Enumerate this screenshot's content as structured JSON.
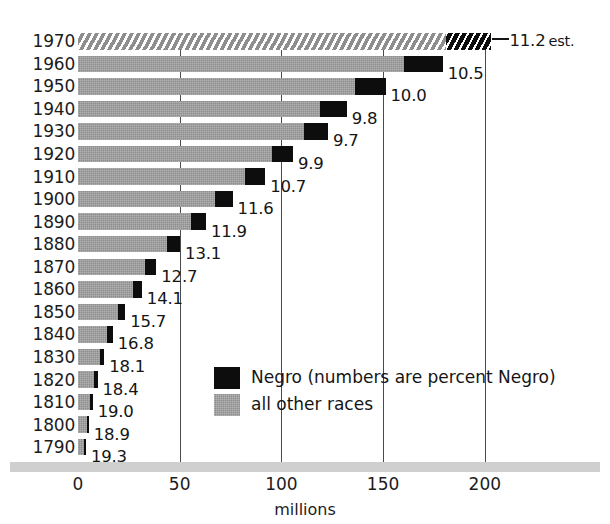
{
  "chart_data": {
    "type": "bar",
    "title": "",
    "subtitle": "",
    "xlabel": "millions",
    "ylabel": "",
    "xlim": [
      0,
      215
    ],
    "ylim": [],
    "grid": "vertical-only",
    "orientation": "horizontal",
    "stacked": true,
    "legend_position": "inside-lower-center",
    "x_ticks": [
      {
        "value": 0,
        "label": "0"
      },
      {
        "value": 50,
        "label": "50"
      },
      {
        "value": 100,
        "label": "100"
      },
      {
        "value": 150,
        "label": "150"
      },
      {
        "value": 200,
        "label": "200"
      }
    ],
    "categories": [
      "1970",
      "1960",
      "1950",
      "1940",
      "1930",
      "1920",
      "1910",
      "1900",
      "1890",
      "1880",
      "1870",
      "1860",
      "1850",
      "1840",
      "1830",
      "1820",
      "1810",
      "1800",
      "1790"
    ],
    "series": [
      {
        "name": "Negro",
        "color": "#0d0d0d",
        "values": [
          22.6,
          18.9,
          15.0,
          12.9,
          11.9,
          10.5,
          9.8,
          8.8,
          7.5,
          6.6,
          5.4,
          4.4,
          3.6,
          2.9,
          2.3,
          1.8,
          1.4,
          1.0,
          0.8
        ]
      },
      {
        "name": "all other races",
        "color": "#8e8e8e",
        "values": [
          180.7,
          160.4,
          136.2,
          119.2,
          111.0,
          95.2,
          82.2,
          67.2,
          55.4,
          43.6,
          33.1,
          27.0,
          19.6,
          14.2,
          10.6,
          7.8,
          5.8,
          4.3,
          3.1
        ]
      }
    ],
    "totals": [
      203.3,
      179.3,
      151.2,
      132.1,
      122.9,
      105.7,
      92.0,
      76.0,
      62.9,
      50.2,
      38.5,
      31.4,
      23.2,
      17.1,
      12.9,
      9.6,
      7.2,
      5.3,
      3.9
    ],
    "point_labels": [
      {
        "category": "1970",
        "percent": "11.2",
        "suffix": "est.",
        "estimated": true
      },
      {
        "category": "1960",
        "percent": "10.5",
        "suffix": "",
        "estimated": false
      },
      {
        "category": "1950",
        "percent": "10.0",
        "suffix": "",
        "estimated": false
      },
      {
        "category": "1940",
        "percent": "9.8",
        "suffix": "",
        "estimated": false
      },
      {
        "category": "1930",
        "percent": "9.7",
        "suffix": "",
        "estimated": false
      },
      {
        "category": "1920",
        "percent": "9.9",
        "suffix": "",
        "estimated": false
      },
      {
        "category": "1910",
        "percent": "10.7",
        "suffix": "",
        "estimated": false
      },
      {
        "category": "1900",
        "percent": "11.6",
        "suffix": "",
        "estimated": false
      },
      {
        "category": "1890",
        "percent": "11.9",
        "suffix": "",
        "estimated": false
      },
      {
        "category": "1880",
        "percent": "13.1",
        "suffix": "",
        "estimated": false
      },
      {
        "category": "1870",
        "percent": "12.7",
        "suffix": "",
        "estimated": false
      },
      {
        "category": "1860",
        "percent": "14.1",
        "suffix": "",
        "estimated": false
      },
      {
        "category": "1850",
        "percent": "15.7",
        "suffix": "",
        "estimated": false
      },
      {
        "category": "1840",
        "percent": "16.8",
        "suffix": "",
        "estimated": false
      },
      {
        "category": "1830",
        "percent": "18.1",
        "suffix": "",
        "estimated": false
      },
      {
        "category": "1820",
        "percent": "18.4",
        "suffix": "",
        "estimated": false
      },
      {
        "category": "1810",
        "percent": "19.0",
        "suffix": "",
        "estimated": false
      },
      {
        "category": "1800",
        "percent": "18.9",
        "suffix": "",
        "estimated": false
      },
      {
        "category": "1790",
        "percent": "19.3",
        "suffix": "",
        "estimated": false
      }
    ],
    "legend": [
      {
        "label": "Negro (numbers are percent Negro)",
        "swatch": "negro",
        "color": "#0d0d0d"
      },
      {
        "label": "all other races",
        "swatch": "other",
        "color": "#8e8e8e"
      }
    ],
    "annotations": [
      "Top bar (1970) is drawn hatched to indicate estimated data."
    ]
  }
}
